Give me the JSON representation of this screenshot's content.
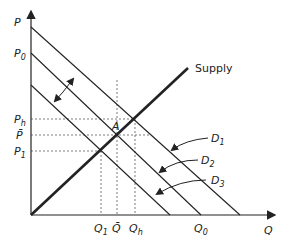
{
  "diagram": {
    "type": "supply-demand",
    "axes": {
      "y_label": "P",
      "x_label": "Q"
    },
    "price_labels": {
      "p0": "P",
      "p0_sub": "0",
      "ph": "P",
      "ph_sub": "h",
      "pbar": "P̄",
      "p1": "P",
      "p1_sub": "1"
    },
    "quantity_labels": {
      "q1": "Q",
      "q1_sub": "1",
      "qbar": "Q̄",
      "qh": "Q",
      "qh_sub": "h",
      "q0": "Q",
      "q0_sub": "0"
    },
    "curves": {
      "supply": "Supply",
      "d1": "D",
      "d1_sub": "1",
      "d2": "D",
      "d2_sub": "2",
      "d3": "D",
      "d3_sub": "3"
    },
    "point_label": "A",
    "colors": {
      "line": "#222222",
      "background": "#ffffff"
    }
  }
}
